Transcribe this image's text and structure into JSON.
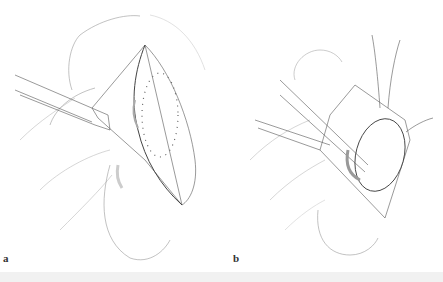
{
  "figure": {
    "panels": [
      {
        "id": "a",
        "label": "a",
        "description": "Elliptical incision with retracted skin flap and dotted outline of tissue to be removed"
      },
      {
        "id": "b",
        "label": "b",
        "description": "Lesion elevated with sutures and dissected with forceps"
      }
    ]
  },
  "colors": {
    "line": "#555555",
    "shade": "#cccccc",
    "band": "#f1f1f1"
  }
}
